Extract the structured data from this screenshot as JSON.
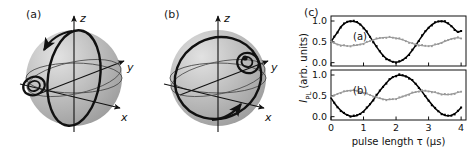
{
  "figure": {
    "panels": [
      {
        "tag": "(a)",
        "kind": "bloch-sphere"
      },
      {
        "tag": "(b)",
        "kind": "bloch-sphere"
      },
      {
        "tag": "(c)",
        "kind": "plot"
      }
    ]
  },
  "bloch": {
    "axis_z": "z",
    "axis_y": "y",
    "axis_x": "x",
    "sphere_fill": "#b3b3b3",
    "sphere_highlight": "#d8d8d8",
    "trajectory_color": "#000000",
    "guide_color": "#333333"
  },
  "plot": {
    "tag": "(c)",
    "sub_a_label": "(a)",
    "sub_b_label": "(b)",
    "ylabel": "I",
    "ylabel_sub": "PL",
    "ylabel_rest": " (arb. units)",
    "xlabel": "pulse length τ (µs)",
    "yticks": [
      "0.0",
      "0.5",
      "1.0"
    ],
    "xticks": [
      "0",
      "1",
      "2",
      "3",
      "4"
    ],
    "black_color": "#000000",
    "gray_color": "#999999"
  },
  "chart_data": [
    {
      "type": "line",
      "title": "(a)",
      "xlabel": "pulse length τ (µs)",
      "ylabel": "I_PL (arb. units)",
      "xlim": [
        0,
        4.15
      ],
      "ylim": [
        -0.08,
        1.12
      ],
      "xticks": [
        0,
        1,
        2,
        3,
        4
      ],
      "yticks": [
        0.0,
        0.5,
        1.0
      ],
      "grid": false,
      "legend": "none",
      "series": [
        {
          "name": "black-signal",
          "color": "#000000",
          "marker": "square",
          "x": [
            0.0,
            0.1,
            0.2,
            0.3,
            0.4,
            0.5,
            0.6,
            0.7,
            0.8,
            0.9,
            1.0,
            1.1,
            1.2,
            1.3,
            1.4,
            1.5,
            1.6,
            1.7,
            1.8,
            1.9,
            2.0,
            2.1,
            2.2,
            2.3,
            2.4,
            2.5,
            2.6,
            2.7,
            2.8,
            2.9,
            3.0,
            3.1,
            3.2,
            3.3,
            3.4,
            3.5,
            3.6,
            3.7,
            3.8,
            3.9,
            4.0
          ],
          "y": [
            0.5,
            0.62,
            0.73,
            0.86,
            0.93,
            0.98,
            1.0,
            0.99,
            0.97,
            0.92,
            0.84,
            0.74,
            0.62,
            0.5,
            0.38,
            0.27,
            0.17,
            0.1,
            0.05,
            0.02,
            0.01,
            0.02,
            0.06,
            0.12,
            0.2,
            0.3,
            0.41,
            0.53,
            0.64,
            0.75,
            0.84,
            0.91,
            0.96,
            0.99,
            1.0,
            0.98,
            0.94,
            0.88,
            0.8,
            0.73,
            0.76
          ]
        },
        {
          "name": "gray-signal",
          "color": "#999999",
          "marker": "square",
          "x": [
            0.0,
            0.1,
            0.2,
            0.3,
            0.4,
            0.5,
            0.6,
            0.7,
            0.8,
            0.9,
            1.0,
            1.1,
            1.2,
            1.3,
            1.4,
            1.5,
            1.6,
            1.7,
            1.8,
            1.9,
            2.0,
            2.1,
            2.2,
            2.3,
            2.4,
            2.5,
            2.6,
            2.7,
            2.8,
            2.9,
            3.0,
            3.1,
            3.2,
            3.3,
            3.4,
            3.5,
            3.6,
            3.7,
            3.8,
            3.9,
            4.0
          ],
          "y": [
            0.5,
            0.47,
            0.44,
            0.42,
            0.41,
            0.4,
            0.4,
            0.41,
            0.42,
            0.44,
            0.46,
            0.49,
            0.52,
            0.55,
            0.57,
            0.59,
            0.6,
            0.61,
            0.61,
            0.6,
            0.59,
            0.57,
            0.55,
            0.52,
            0.49,
            0.46,
            0.44,
            0.42,
            0.41,
            0.4,
            0.4,
            0.41,
            0.43,
            0.45,
            0.48,
            0.51,
            0.54,
            0.57,
            0.59,
            0.6,
            0.58
          ]
        }
      ]
    },
    {
      "type": "line",
      "title": "(b)",
      "xlabel": "pulse length τ (µs)",
      "ylabel": "I_PL (arb. units)",
      "xlim": [
        0,
        4.15
      ],
      "ylim": [
        -0.08,
        1.12
      ],
      "xticks": [
        0,
        1,
        2,
        3,
        4
      ],
      "yticks": [
        0.0,
        0.5,
        1.0
      ],
      "grid": false,
      "legend": "none",
      "series": [
        {
          "name": "black-signal",
          "color": "#000000",
          "marker": "square",
          "x": [
            0.0,
            0.1,
            0.2,
            0.3,
            0.4,
            0.5,
            0.6,
            0.7,
            0.8,
            0.9,
            1.0,
            1.1,
            1.2,
            1.3,
            1.4,
            1.5,
            1.6,
            1.7,
            1.8,
            1.9,
            2.0,
            2.1,
            2.2,
            2.3,
            2.4,
            2.5,
            2.6,
            2.7,
            2.8,
            2.9,
            3.0,
            3.1,
            3.2,
            3.3,
            3.4,
            3.5,
            3.6,
            3.7,
            3.8,
            3.9,
            4.0
          ],
          "y": [
            0.45,
            0.33,
            0.23,
            0.15,
            0.08,
            0.04,
            0.01,
            0.01,
            0.03,
            0.07,
            0.13,
            0.21,
            0.3,
            0.4,
            0.51,
            0.62,
            0.72,
            0.81,
            0.89,
            0.95,
            0.98,
            1.0,
            0.99,
            0.97,
            0.93,
            0.87,
            0.79,
            0.7,
            0.6,
            0.49,
            0.39,
            0.29,
            0.2,
            0.13,
            0.07,
            0.03,
            0.02,
            0.03,
            0.07,
            0.13,
            0.22
          ]
        },
        {
          "name": "gray-signal",
          "color": "#999999",
          "marker": "square",
          "x": [
            0.0,
            0.1,
            0.2,
            0.3,
            0.4,
            0.5,
            0.6,
            0.7,
            0.8,
            0.9,
            1.0,
            1.1,
            1.2,
            1.3,
            1.4,
            1.5,
            1.6,
            1.7,
            1.8,
            1.9,
            2.0,
            2.1,
            2.2,
            2.3,
            2.4,
            2.5,
            2.6,
            2.7,
            2.8,
            2.9,
            3.0,
            3.1,
            3.2,
            3.3,
            3.4,
            3.5,
            3.6,
            3.7,
            3.8,
            3.9,
            4.0
          ],
          "y": [
            0.47,
            0.51,
            0.55,
            0.58,
            0.6,
            0.62,
            0.63,
            0.63,
            0.62,
            0.6,
            0.58,
            0.55,
            0.52,
            0.49,
            0.46,
            0.44,
            0.42,
            0.41,
            0.41,
            0.42,
            0.43,
            0.45,
            0.48,
            0.51,
            0.54,
            0.57,
            0.59,
            0.61,
            0.62,
            0.62,
            0.61,
            0.6,
            0.58,
            0.56,
            0.54,
            0.53,
            0.53,
            0.54,
            0.56,
            0.58,
            0.6
          ]
        }
      ]
    }
  ]
}
